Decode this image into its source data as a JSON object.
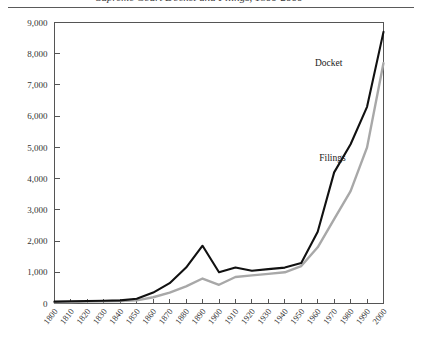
{
  "figure": {
    "caption": "Supreme Court Docket and Filings, 1800-2000",
    "rule_color": "#5a5a5a"
  },
  "chart_data": {
    "type": "line",
    "title": "",
    "xlabel": "",
    "ylabel": "",
    "xlim": [
      1800,
      2000
    ],
    "ylim": [
      0,
      9000
    ],
    "grid": false,
    "legend_position": "inline-right",
    "x": [
      1800,
      1810,
      1820,
      1830,
      1840,
      1850,
      1860,
      1870,
      1880,
      1890,
      1900,
      1910,
      1920,
      1930,
      1940,
      1950,
      1960,
      1970,
      1980,
      1990,
      2000
    ],
    "xtick_labels": [
      "1800",
      "1810",
      "1820",
      "1830",
      "1840",
      "1850",
      "1860",
      "1870",
      "1880",
      "1890",
      "1900",
      "1910",
      "1920",
      "1930",
      "1940",
      "1950",
      "1960",
      "1970",
      "1980",
      "1990",
      "2000"
    ],
    "ytick_values": [
      0,
      1000,
      2000,
      3000,
      4000,
      5000,
      6000,
      7000,
      8000,
      9000
    ],
    "ytick_labels": [
      "0",
      "1,000",
      "2,000",
      "3,000",
      "4,000",
      "5,000",
      "6,000",
      "7,000",
      "8,000",
      "9,000"
    ],
    "series": [
      {
        "name": "Docket",
        "label": "Docket",
        "color": "#111111",
        "width": 2.1,
        "values": [
          60,
          70,
          80,
          90,
          100,
          150,
          350,
          650,
          1150,
          1850,
          1000,
          1150,
          1050,
          1100,
          1150,
          1300,
          2300,
          4200,
          5100,
          6300,
          8700
        ]
      },
      {
        "name": "Filings",
        "label": "Filings",
        "color": "#a8a8a8",
        "width": 2.4,
        "values": [
          40,
          50,
          60,
          70,
          80,
          100,
          200,
          350,
          550,
          800,
          600,
          850,
          900,
          950,
          1000,
          1200,
          1800,
          2700,
          3600,
          5000,
          7700
        ]
      }
    ],
    "annotations": [
      {
        "text": "Docket",
        "x": 1975,
        "y": 7600
      },
      {
        "text": "Filings",
        "x": 1977,
        "y": 4550
      }
    ]
  }
}
